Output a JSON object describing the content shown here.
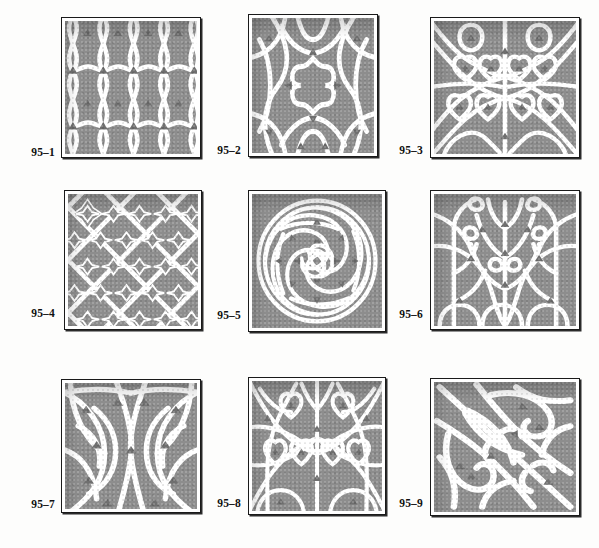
{
  "plate": {
    "title": "Plate 95 — Gothic tracery panel designs",
    "columns": 3,
    "rows": 3,
    "background_color": "#fdfdfc",
    "fill_color": "#8d8d8d",
    "tracery_color": "#ffffff",
    "frame_color": "#1a1a1a"
  },
  "figures": [
    {
      "id": "95-1",
      "label": "95–1",
      "description": "Vertical ogee net tracery with pointed leaf cusps",
      "pattern": "ogee-net",
      "x": 61,
      "y": 17,
      "w": 140,
      "h": 141,
      "label_x": 10,
      "label_y": 146,
      "label_w": 45
    },
    {
      "id": "95-2",
      "label": "95–2",
      "description": "Quatrefoil cross centre with sweeping curved bars",
      "pattern": "cross-quatrefoil",
      "x": 248,
      "y": 14,
      "w": 130,
      "h": 143,
      "label_x": 196,
      "label_y": 144,
      "label_w": 45
    },
    {
      "id": "95-3",
      "label": "95–3",
      "description": "Mirrored intersecting arches with trefoil heads",
      "pattern": "mirrored-arch-trefoil",
      "x": 430,
      "y": 17,
      "w": 150,
      "h": 141,
      "label_x": 378,
      "label_y": 144,
      "label_w": 45
    },
    {
      "id": "95-4",
      "label": "95–4",
      "description": "Diagonal lattice diaper of cusped quatrefoil crosses",
      "pattern": "diagonal-lattice",
      "x": 64,
      "y": 190,
      "w": 138,
      "h": 140,
      "label_x": 10,
      "label_y": 307,
      "label_w": 45
    },
    {
      "id": "95-5",
      "label": "95–5",
      "description": "Circular whirling mouchette rosette within a square",
      "pattern": "whirl-rosette",
      "x": 248,
      "y": 190,
      "w": 138,
      "h": 142,
      "label_x": 196,
      "label_y": 309,
      "label_w": 45
    },
    {
      "id": "95-6",
      "label": "95–6",
      "description": "Branching tree tracery with daggers and trefoil cusps",
      "pattern": "branching-tree",
      "x": 430,
      "y": 190,
      "w": 150,
      "h": 140,
      "label_x": 378,
      "label_y": 308,
      "label_w": 45
    },
    {
      "id": "95-7",
      "label": "95–7",
      "description": "Large flowing curvilinear leaf forms, mirrored pair",
      "pattern": "flowing-leaf",
      "x": 61,
      "y": 379,
      "w": 140,
      "h": 134,
      "label_x": 10,
      "label_y": 498,
      "label_w": 45
    },
    {
      "id": "95-8",
      "label": "95–8",
      "description": "Symmetrical foliated tracery with trefoil clusters",
      "pattern": "foliated-symmetry",
      "x": 248,
      "y": 377,
      "w": 138,
      "h": 138,
      "label_x": 196,
      "label_y": 497,
      "label_w": 45
    },
    {
      "id": "95-9",
      "label": "95–9",
      "description": "Diagonal thorned branch with bold curving stems",
      "pattern": "diagonal-thorn",
      "x": 430,
      "y": 378,
      "w": 150,
      "h": 138,
      "label_x": 378,
      "label_y": 497,
      "label_w": 45
    }
  ]
}
